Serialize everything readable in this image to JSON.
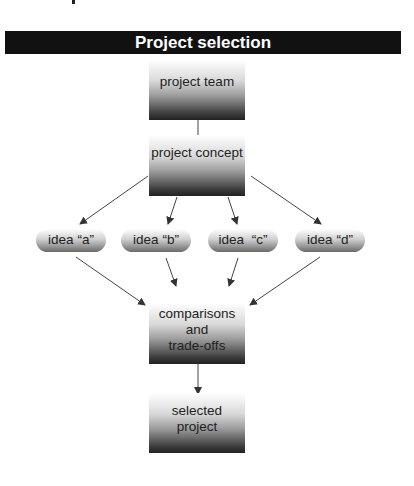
{
  "title": "Project selection",
  "nodes": {
    "team": "project team",
    "concept": "project concept",
    "ideas": [
      "idea “a”",
      "idea “b”",
      "idea  “c”",
      "idea “d”"
    ],
    "comparisons": [
      "comparisons",
      "and",
      "trade-offs"
    ],
    "selected": [
      "selected",
      "project"
    ]
  },
  "colors": {
    "banner": "#111111",
    "banner_text": "#ffffff",
    "arrow": "#333333"
  }
}
